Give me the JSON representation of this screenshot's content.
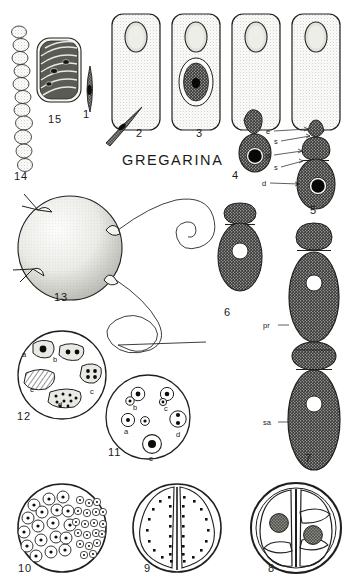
{
  "plate": {
    "title": "GREGARINA",
    "background_color": "#ffffff",
    "ink_color": "#1b1b1b",
    "width": 353,
    "height": 588,
    "subject": "gregarine protozoan life-cycle plate"
  },
  "figures": [
    {
      "id": "fig1",
      "number": "1",
      "type": "sporozoite",
      "description": "small slender spindle-shaped sporozoite with dark nucleus",
      "label_x": 83,
      "label_y": 118
    },
    {
      "id": "fig2",
      "number": "2",
      "type": "host-cell-with-sporozoite",
      "description": "stippled columnar host epithelial cell with apical nucleus and attached sporozoite at base",
      "label_x": 136,
      "label_y": 137
    },
    {
      "id": "fig3",
      "number": "3",
      "type": "host-cell-intracellular-trophozoite",
      "description": "host cell containing encapsulated intracellular trophozoite with dark nucleus",
      "label_x": 196,
      "label_y": 137
    },
    {
      "id": "fig4",
      "number": "4",
      "type": "emerging-trophozoite",
      "description": "trophozoite partly emerged from host cell, dark granular body with large pale nucleus",
      "label_x": 232,
      "label_y": 179
    },
    {
      "id": "fig5",
      "number": "5",
      "type": "cephalont",
      "description": "attached cephalont showing epimerite, septa, protomerite and deutomerite",
      "label_x": 316,
      "label_y": 197
    },
    {
      "id": "fig6",
      "number": "6",
      "type": "sporont",
      "description": "free two-segmented sporont with protomerite and deutomerite, pale nucleus",
      "label_x": 224,
      "label_y": 316
    },
    {
      "id": "fig7",
      "number": "7",
      "type": "syzygy",
      "description": "syzygy: primite and satellite gregarines joined in chain",
      "label_x": 310,
      "label_y": 459
    },
    {
      "id": "fig8",
      "number": "8",
      "type": "gametocyst-two-gamonts",
      "description": "gametocyst containing two associated gamonts each with a dark granular nucleus",
      "label_x": 271,
      "label_y": 570
    },
    {
      "id": "fig9",
      "number": "9",
      "type": "gametocyst-gametes-at-surface",
      "description": "gametocyst with two gamonts whose nuclei have migrated to the surface as gametes",
      "label_x": 148,
      "label_y": 570
    },
    {
      "id": "fig10",
      "number": "10",
      "type": "gametocyst-gamete-formation",
      "description": "gametocyst filled with male and female gametes of differing size",
      "label_x": 22,
      "label_y": 570
    },
    {
      "id": "fig11",
      "number": "11",
      "type": "gamete-fusion-series",
      "description": "cyst section showing stages a-e of gamete pairing and fusion",
      "label_x": 113,
      "label_y": 455
    },
    {
      "id": "fig12",
      "number": "12",
      "type": "sporoblast-series",
      "description": "cyst section showing stages a-e of zygote nuclear division into sporoblasts",
      "label_x": 17,
      "label_y": 418
    },
    {
      "id": "fig13",
      "number": "13",
      "type": "dehiscing-gametocyst",
      "description": "mature gametocyst with sporoducts extruding long coiled spore chains",
      "label_x": 56,
      "label_y": 298
    },
    {
      "id": "fig14",
      "number": "14",
      "type": "spore-chain",
      "description": "chain of barrel-shaped oocysts (spores) extruded from sporoduct",
      "label_x": 14,
      "label_y": 180
    },
    {
      "id": "fig15",
      "number": "15",
      "type": "oocyst-with-sporozoites",
      "description": "single striated oocyst containing eight sporozoites",
      "label_x": 48,
      "label_y": 123
    }
  ],
  "part_labels": [
    {
      "id": "lbl-e",
      "text": "e",
      "figure": "5",
      "meaning": "epimerite",
      "x": 268,
      "y": 132
    },
    {
      "id": "lbl-s1",
      "text": "s",
      "figure": "5",
      "meaning": "septum",
      "x": 276,
      "y": 142
    },
    {
      "id": "lbl-p",
      "text": "p",
      "figure": "5",
      "meaning": "protomerite",
      "x": 268,
      "y": 156
    },
    {
      "id": "lbl-s2",
      "text": "s",
      "figure": "5",
      "meaning": "septum",
      "x": 276,
      "y": 167
    },
    {
      "id": "lbl-d",
      "text": "d",
      "figure": "5",
      "meaning": "deutomerite",
      "x": 264,
      "y": 182
    },
    {
      "id": "lbl-pr",
      "text": "pr",
      "figure": "7",
      "meaning": "primite",
      "x": 265,
      "y": 325
    },
    {
      "id": "lbl-sa",
      "text": "sa",
      "figure": "7",
      "meaning": "satellite",
      "x": 265,
      "y": 422
    }
  ],
  "fig12_stages": [
    {
      "letter": "a",
      "x": 22,
      "y": 354,
      "content": "single large nucleus"
    },
    {
      "letter": "b",
      "x": 53,
      "y": 359,
      "content": "two nuclei"
    },
    {
      "letter": "c",
      "x": 92,
      "y": 381,
      "content": "four nuclei"
    },
    {
      "letter": "d",
      "x": 58,
      "y": 404,
      "content": "many nuclei"
    },
    {
      "letter": "e",
      "x": 30,
      "y": 388,
      "content": "striated sporoblast"
    }
  ],
  "fig11_stages": [
    {
      "letter": "a",
      "x": 118,
      "y": 431,
      "content": "two separate gametes"
    },
    {
      "letter": "b",
      "x": 126,
      "y": 407,
      "content": "gametes in contact"
    },
    {
      "letter": "c",
      "x": 158,
      "y": 409,
      "content": "gametes fusing"
    },
    {
      "letter": "d",
      "x": 174,
      "y": 434,
      "content": "two nuclei in one body"
    },
    {
      "letter": "e",
      "x": 146,
      "y": 458,
      "content": "zygote with single nucleus"
    }
  ],
  "title_position": {
    "x": 122,
    "y": 165
  }
}
